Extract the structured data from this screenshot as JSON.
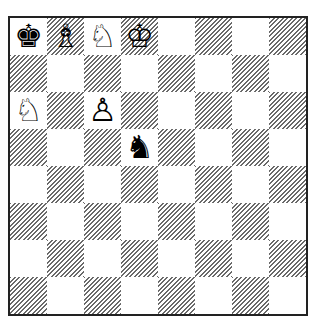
{
  "board": {
    "orientation": "white-bottom",
    "files": [
      "a",
      "b",
      "c",
      "d",
      "e",
      "f",
      "g",
      "h"
    ],
    "ranks": [
      8,
      7,
      6,
      5,
      4,
      3,
      2,
      1
    ],
    "light_color": "#ffffff",
    "dark_hatch_color": "#6a6a6a",
    "border_color": "#222222",
    "pieces": [
      {
        "square": "a8",
        "color": "black",
        "type": "king",
        "glyph": "♚",
        "name": "black-king"
      },
      {
        "square": "b8",
        "color": "white",
        "type": "bishop",
        "glyph": "♗",
        "name": "white-bishop"
      },
      {
        "square": "c8",
        "color": "white",
        "type": "knight",
        "glyph": "♘",
        "name": "white-knight"
      },
      {
        "square": "d8",
        "color": "white",
        "type": "king",
        "glyph": "♔",
        "name": "white-king"
      },
      {
        "square": "a6",
        "color": "white",
        "type": "knight",
        "glyph": "♘",
        "name": "white-knight"
      },
      {
        "square": "c6",
        "color": "white",
        "type": "pawn",
        "glyph": "♙",
        "name": "white-pawn"
      },
      {
        "square": "d5",
        "color": "black",
        "type": "knight",
        "glyph": "♞",
        "name": "black-knight"
      }
    ]
  }
}
